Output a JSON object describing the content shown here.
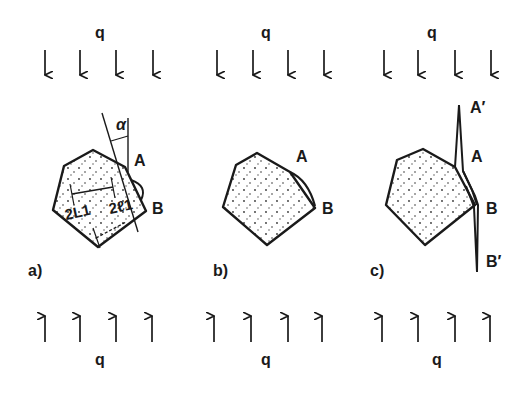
{
  "figure": {
    "stroke_color": "#1a1a1a",
    "background": "#ffffff",
    "panels": [
      {
        "id": "a",
        "label": "a)",
        "load_top": "q",
        "load_bottom": "q",
        "point_a": "A",
        "point_b": "B",
        "angle_symbol": "α",
        "dim_length": "2L1",
        "dim_width": "2ℓ1"
      },
      {
        "id": "b",
        "label": "b)",
        "load_top": "q",
        "load_bottom": "q",
        "point_a": "A",
        "point_b": "B"
      },
      {
        "id": "c",
        "label": "c)",
        "load_top": "q",
        "load_bottom": "q",
        "point_a": "A",
        "point_b": "B",
        "point_a_prime": "A′",
        "point_b_prime": "B′"
      }
    ]
  }
}
